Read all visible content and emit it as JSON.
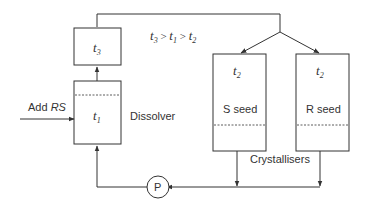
{
  "diagram": {
    "colors": {
      "line": "#333333",
      "background": "#ffffff"
    },
    "condition": {
      "t3": "t",
      "s3": "3",
      "gt1": " > ",
      "t1": "t",
      "s1": "1",
      "gt2": " > ",
      "t2": "t",
      "s2": "2"
    },
    "boxes": {
      "heater": {
        "var": "t",
        "sub": "3"
      },
      "dissolver": {
        "var": "t",
        "sub": "1",
        "label": "Dissolver"
      },
      "crystalliser_s": {
        "var": "t",
        "sub": "2",
        "seed": "S seed"
      },
      "crystalliser_r": {
        "var": "t",
        "sub": "2",
        "seed": "R seed"
      }
    },
    "feed": {
      "prefix": "Add ",
      "species": "RS"
    },
    "pump": {
      "label": "P"
    },
    "crystallisers_label": "Crystallisers"
  }
}
